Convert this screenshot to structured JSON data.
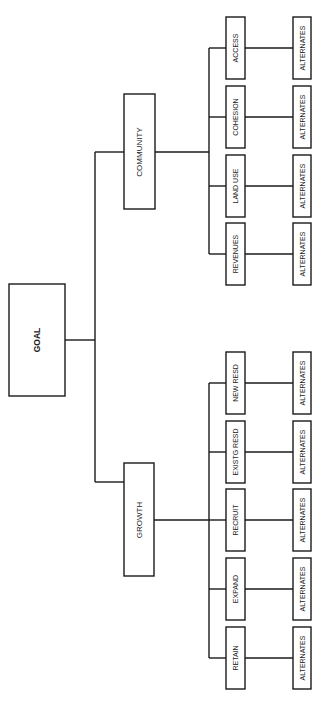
{
  "diagram": {
    "type": "hierarchy-tree",
    "root": {
      "label": "GOAL",
      "children": [
        {
          "label": "COMMUNITY",
          "children": [
            {
              "label": "ACCESS",
              "alternative": "ALTERNATES"
            },
            {
              "label": "COHESION",
              "alternative": "ALTERNATES"
            },
            {
              "label": "LAND USE",
              "alternative": "ALTERNATES"
            },
            {
              "label": "REVENUES",
              "alternative": "ALTERNATES"
            }
          ]
        },
        {
          "label": "GROWTH",
          "children": [
            {
              "label": "NEW RESD",
              "alternative": "ALTERNATES"
            },
            {
              "label": "EXISTG RESD",
              "alternative": "ALTERNATES"
            },
            {
              "label": "RECRUIT",
              "alternative": "ALTERNATES"
            },
            {
              "label": "EXPAND",
              "alternative": "ALTERNATES"
            },
            {
              "label": "RETAIN",
              "alternative": "ALTERNATES"
            }
          ]
        }
      ]
    }
  }
}
